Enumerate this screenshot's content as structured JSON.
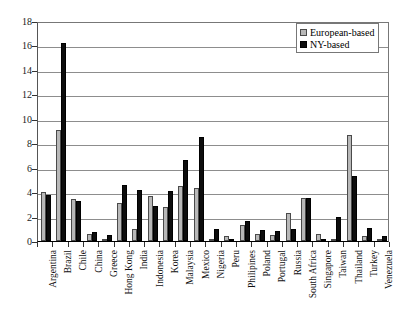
{
  "chart_data": {
    "type": "bar",
    "title": "",
    "xlabel": "",
    "ylabel": "",
    "ylim": [
      0,
      18
    ],
    "ytick_step": 2,
    "yticks": [
      "0",
      "2",
      "4",
      "6",
      "8",
      "10",
      "12",
      "14",
      "16",
      "18"
    ],
    "grid": true,
    "legend_position": "top-right",
    "categories": [
      "Argentina",
      "Brazil",
      "Chile",
      "China",
      "Greece",
      "Hong Kong",
      "India",
      "Indonesia",
      "Korea",
      "Malaysia",
      "Mexico",
      "Nigeria",
      "Peru",
      "Philipines",
      "Poland",
      "Portugal",
      "Russia",
      "South Africa",
      "Singapore",
      "Taiwan",
      "Thailand",
      "Turkey",
      "Venezuela"
    ],
    "series": [
      {
        "name": "European-based",
        "color": "#b8b8b8",
        "values": [
          4.0,
          9.1,
          3.4,
          0.6,
          0.2,
          3.1,
          1.0,
          3.7,
          2.8,
          4.5,
          4.3,
          0.2,
          0.4,
          1.3,
          0.6,
          0.5,
          2.3,
          3.5,
          0.6,
          0.2,
          8.7,
          0.4,
          0.2
        ]
      },
      {
        "name": "NY-based",
        "color": "#0d0d0d",
        "values": [
          3.8,
          16.2,
          3.3,
          0.7,
          0.5,
          4.6,
          4.2,
          2.9,
          4.1,
          6.6,
          8.5,
          1.0,
          0.1,
          1.6,
          0.9,
          0.8,
          1.0,
          3.5,
          0.2,
          2.0,
          5.3,
          1.1,
          0.4
        ]
      }
    ]
  },
  "legend": {
    "items": [
      {
        "label": "European-based",
        "swatch": "eu"
      },
      {
        "label": "NY-based",
        "swatch": "ny"
      }
    ]
  }
}
